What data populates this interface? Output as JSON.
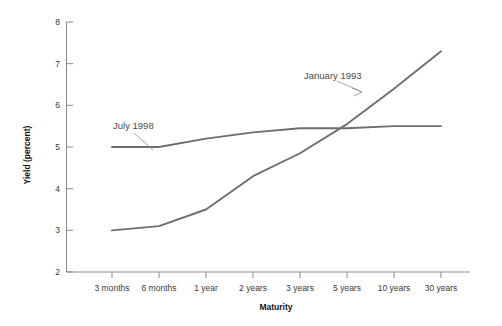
{
  "chart_data": {
    "type": "line",
    "title": "",
    "xlabel": "Maturity",
    "ylabel": "Yield (percent)",
    "categories": [
      "3 months",
      "6 months",
      "1 year",
      "2 years",
      "3 years",
      "5 years",
      "10 years",
      "30 years"
    ],
    "ylim": [
      2,
      8
    ],
    "yticks": [
      "2",
      "3",
      "4",
      "5",
      "6",
      "7",
      "8"
    ],
    "grid": false,
    "legend_position": "inline-annotation",
    "series": [
      {
        "name": "July 1998",
        "label": "July 1998",
        "color": "#6e6e6e",
        "values": [
          5.0,
          5.0,
          5.2,
          5.35,
          5.45,
          5.45,
          5.5,
          5.5
        ]
      },
      {
        "name": "January 1993",
        "label": "January 1993",
        "color": "#6e6e6e",
        "values": [
          3.0,
          3.1,
          3.5,
          4.3,
          4.85,
          5.55,
          6.4,
          7.3
        ]
      }
    ],
    "annotations": [
      {
        "text": "July 1998",
        "target_series": "July 1998"
      },
      {
        "text": "January 1993",
        "target_series": "January 1993"
      }
    ]
  }
}
